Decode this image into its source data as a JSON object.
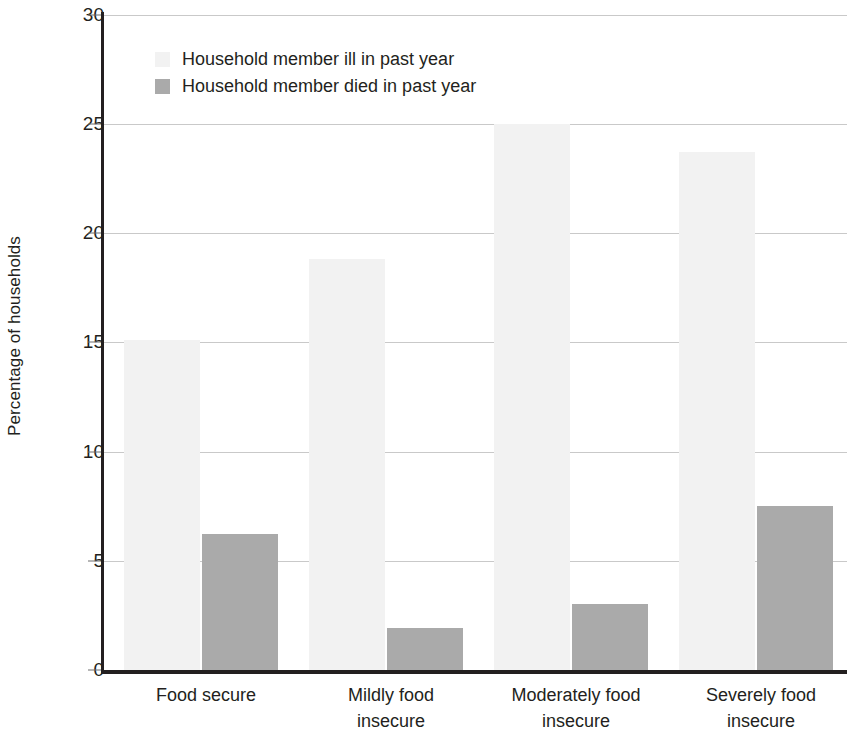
{
  "chart_data": {
    "type": "bar",
    "title": "",
    "xlabel": "",
    "ylabel": "Percentage of households",
    "ylim": [
      0,
      30
    ],
    "yticks": [
      0,
      5,
      10,
      15,
      20,
      25,
      30
    ],
    "ytick_labels": [
      "0",
      "5",
      "10",
      "15",
      "20",
      "25",
      "30"
    ],
    "grid": true,
    "legend_position": "upper-left-inside",
    "categories": [
      "Food secure",
      "Mildly food insecure",
      "Moderately food insecure",
      "Severely food insecure"
    ],
    "category_lines": [
      [
        "Food secure"
      ],
      [
        "Mildly food",
        "insecure"
      ],
      [
        "Moderately food",
        "insecure"
      ],
      [
        "Severely food",
        "insecure"
      ]
    ],
    "series": [
      {
        "name": "Household member ill in past year",
        "color": "#f2f2f2",
        "values": [
          15.2,
          18.9,
          25.1,
          23.8
        ]
      },
      {
        "name": "Household member died in past year",
        "color": "#aaaaaa",
        "values": [
          6.3,
          2.0,
          3.1,
          7.6
        ]
      }
    ]
  },
  "legend": {
    "items": [
      {
        "label": "Household member ill in past year",
        "swatch": "light"
      },
      {
        "label": "Household member died in past year",
        "swatch": "dark"
      }
    ]
  },
  "axes": {
    "y_title": "Percentage of households",
    "y_ticks": [
      "30",
      "25",
      "20",
      "15",
      "10",
      "5",
      "0"
    ]
  }
}
